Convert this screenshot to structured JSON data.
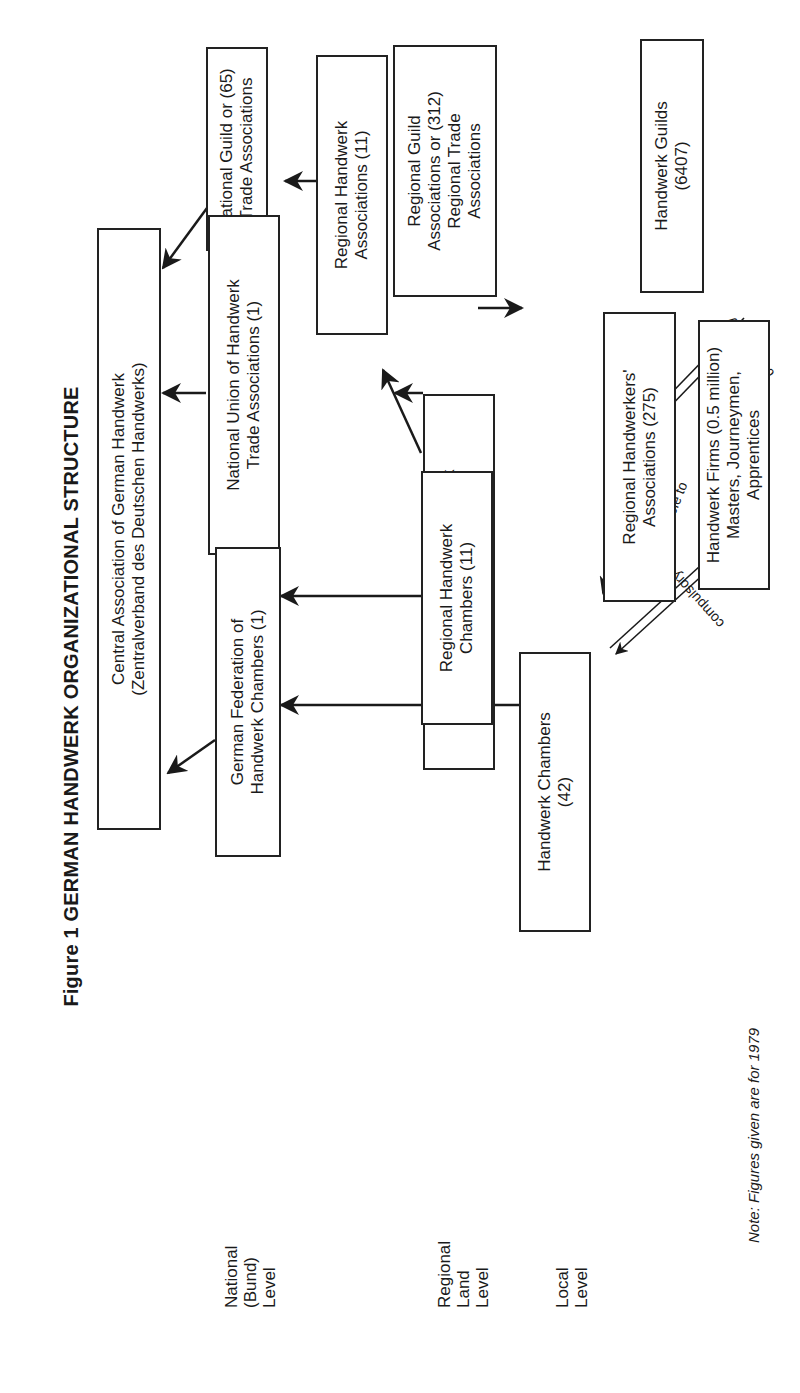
{
  "figure": {
    "title": "Figure 1  GERMAN HANDWERK ORGANIZATIONAL STRUCTURE",
    "note": "Note: Figures given are for 1979"
  },
  "levels": {
    "national": [
      "National",
      "(Bund)",
      "Level"
    ],
    "regional": [
      "Regional",
      "Land",
      "Level"
    ],
    "local": [
      "Local",
      "Level"
    ]
  },
  "boxes": {
    "central_association": [
      "Central Association of German Handwerk",
      "(Zentralverband des Deutschen Handwerks)"
    ],
    "national_guild": [
      "National Guild or (65)",
      "Trade Associations"
    ],
    "regional_guild": [
      "Regional Guild",
      "Associations or (312)",
      "Regional Trade",
      "Associations"
    ],
    "handwerk_guilds": [
      "Handwerk Guilds",
      "(6407)"
    ],
    "national_union": [
      "National Union of Handwerk",
      "Trade Associations (1)"
    ],
    "regional_handwerk_assoc": [
      "Regional Handwerk",
      "Associations (11)"
    ],
    "regional_unions": [
      "Regional Unions of Handwerk",
      "Trade Associations (12)"
    ],
    "regional_handwerkers_assoc": [
      "Regional Handwerkers'",
      "Associations (275)"
    ],
    "handwerk_firms": [
      "Handwerk Firms (0.5 million)",
      "Masters, Journeymen, Apprentices"
    ],
    "german_federation": [
      "German Federation of",
      "Handwerk Chambers (1)"
    ],
    "regional_chambers": [
      "Regional Handwerk",
      "Chambers (11)"
    ],
    "handwerk_chambers": [
      "Handwerk Chambers",
      "(42)"
    ]
  },
  "edge_labels": {
    "compulsory_guilds": "compulsory",
    "compulsory_firms": "compulsory",
    "responsible_to": "responsible to"
  },
  "colors": {
    "ink": "#1a1a1a",
    "background": "#ffffff"
  }
}
